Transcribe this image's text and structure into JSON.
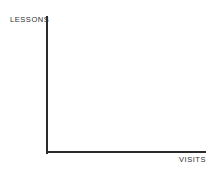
{
  "figure": {
    "width": 219,
    "height": 173,
    "background_color": "#ffffff",
    "axis_color": "#2b2b2b",
    "label_color": "#2e2e2e"
  },
  "chart_data": {
    "type": "line",
    "title": "",
    "subtitle": "",
    "xlabel": "VISITS",
    "ylabel": "LESSONS",
    "series": [],
    "x": [],
    "categories": [],
    "values": [],
    "xticklabels": [],
    "yticklabels": [],
    "xlim": [
      0,
      0
    ],
    "ylim": [
      0,
      0
    ],
    "grid": false,
    "legend": false,
    "legend_position": "none",
    "annotations": []
  }
}
